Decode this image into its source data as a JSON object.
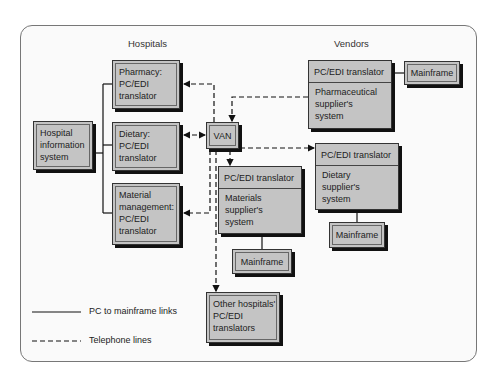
{
  "labels": {
    "hospitals": "Hospitals",
    "vendors": "Vendors"
  },
  "hospital_side": {
    "hospital_info_system": "Hospital\ninformation\nsystem",
    "pharmacy": "Pharmacy:\nPC/EDI\ntranslator",
    "dietary": "Dietary:\nPC/EDI\ntranslator",
    "material_management": "Material\nmanagement:\nPC/EDI\ntranslator"
  },
  "van": "VAN",
  "vendor_side": {
    "pharmaceutical": {
      "header": "PC/EDI translator",
      "body": "Pharmaceutical\nsupplier's\nsystem",
      "mainframe": "Mainframe"
    },
    "dietary": {
      "header": "PC/EDI translator",
      "body": "Dietary\nsupplier's\nsystem",
      "mainframe": "Mainframe"
    },
    "materials": {
      "header": "PC/EDI translator",
      "body": "Materials\nsupplier's\nsystem",
      "mainframe": "Mainframe"
    }
  },
  "other_hospitals": "Other hospitals'\nPC/EDI\ntranslators",
  "legend": {
    "solid": "PC to mainframe links",
    "dashed": "Telephone lines"
  },
  "colors": {
    "box_fill": "#c4c4c4",
    "frame_bg": "#fafafa",
    "line": "#111111"
  }
}
